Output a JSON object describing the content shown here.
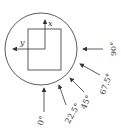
{
  "diagram": {
    "axes": {
      "x_label": "x",
      "y_label": "y"
    },
    "load_angles": [
      {
        "label": "0°",
        "angle": 0
      },
      {
        "label": "22.5°",
        "angle": 22.5
      },
      {
        "label": "45°",
        "angle": 45
      },
      {
        "label": "67.5°",
        "angle": 67.5
      },
      {
        "label": "90°",
        "angle": 90
      }
    ],
    "colors": {
      "stroke": "#333333",
      "background": "#ffffff"
    }
  }
}
